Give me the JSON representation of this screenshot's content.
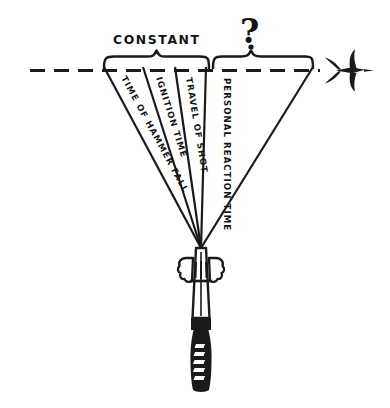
{
  "figure": {
    "background_color": "#ffffff",
    "ink_color": "#1a1a1a"
  },
  "annotations": {
    "constant_label": "CONSTANT",
    "variable_label": "?"
  },
  "segments": [
    {
      "id": "time-of-hammer-fall",
      "label": "TIME OF HAMMER FALL",
      "group": "CONSTANT"
    },
    {
      "id": "ignition-time",
      "label": "IGNITION TIME",
      "group": "CONSTANT"
    },
    {
      "id": "travel-of-shot",
      "label": "TRAVEL OF SHOT",
      "group": "CONSTANT"
    },
    {
      "id": "personal-reaction-time",
      "label": "PERSONAL REACTION TIME",
      "group": "?"
    }
  ],
  "elements": {
    "sight_line": "dashed-horizontal-sight-line",
    "target": "flying-bird-target",
    "muzzle_apex": "shotgun-muzzle-convergence-point",
    "firearm": "shotgun-with-hands",
    "brace_constant": "brace-constant",
    "brace_variable": "brace-variable"
  }
}
